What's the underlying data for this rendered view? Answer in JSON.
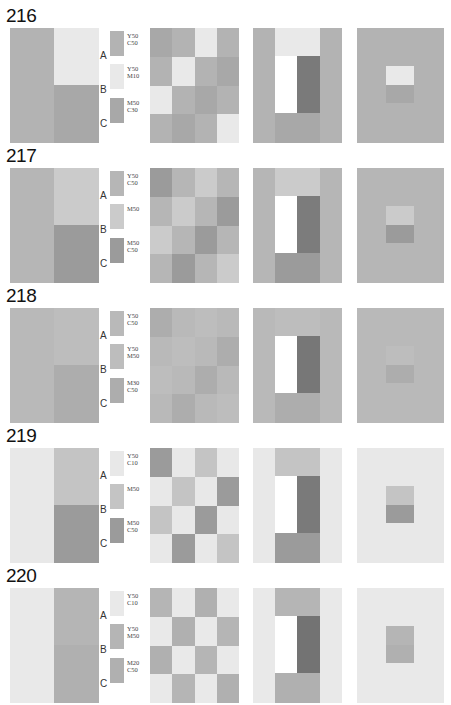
{
  "rows": [
    {
      "number": "216",
      "top": 5,
      "colors": {
        "A": "#b3b3b3",
        "B": "#e9e9e9",
        "C": "#a8a8a8",
        "dark": "#7a7a7a"
      },
      "swatches": [
        {
          "letter": "A",
          "code_line1": "Y50",
          "code_line2": "C50"
        },
        {
          "letter": "B",
          "code_line1": "Y50",
          "code_line2": "M10"
        },
        {
          "letter": "C",
          "code_line1": "M50",
          "code_line2": "C30"
        }
      ],
      "checker": [
        "C",
        "A",
        "B",
        "A",
        "A",
        "B",
        "A",
        "C",
        "B",
        "A",
        "C",
        "A",
        "A",
        "C",
        "A",
        "B"
      ]
    },
    {
      "number": "217",
      "top": 145,
      "colors": {
        "A": "#b6b6b6",
        "B": "#cbcbcb",
        "C": "#9b9b9b",
        "dark": "#7c7c7c"
      },
      "swatches": [
        {
          "letter": "A",
          "code_line1": "Y50",
          "code_line2": "C50"
        },
        {
          "letter": "B",
          "code_line1": "M50",
          "code_line2": ""
        },
        {
          "letter": "C",
          "code_line1": "M50",
          "code_line2": "C50"
        }
      ],
      "checker": [
        "C",
        "A",
        "B",
        "A",
        "A",
        "B",
        "A",
        "C",
        "B",
        "A",
        "C",
        "A",
        "A",
        "C",
        "A",
        "B"
      ]
    },
    {
      "number": "218",
      "top": 285,
      "colors": {
        "A": "#b9b9b9",
        "B": "#bdbdbd",
        "C": "#adadad",
        "dark": "#777777"
      },
      "swatches": [
        {
          "letter": "A",
          "code_line1": "Y50",
          "code_line2": "C50"
        },
        {
          "letter": "B",
          "code_line1": "Y50",
          "code_line2": "M50"
        },
        {
          "letter": "C",
          "code_line1": "M30",
          "code_line2": "C50"
        }
      ],
      "checker": [
        "C",
        "A",
        "B",
        "A",
        "A",
        "B",
        "A",
        "C",
        "B",
        "A",
        "C",
        "A",
        "A",
        "C",
        "A",
        "B"
      ]
    },
    {
      "number": "219",
      "top": 425,
      "colors": {
        "A": "#e8e8e8",
        "B": "#c4c4c4",
        "C": "#9b9b9b",
        "dark": "#7a7a7a"
      },
      "swatches": [
        {
          "letter": "A",
          "code_line1": "Y50",
          "code_line2": "C10"
        },
        {
          "letter": "B",
          "code_line1": "M50",
          "code_line2": ""
        },
        {
          "letter": "C",
          "code_line1": "M50",
          "code_line2": "C50"
        }
      ],
      "checker": [
        "C",
        "A",
        "B",
        "A",
        "A",
        "B",
        "A",
        "C",
        "B",
        "A",
        "C",
        "A",
        "A",
        "C",
        "A",
        "B"
      ]
    },
    {
      "number": "220",
      "top": 565,
      "colors": {
        "A": "#e9e9e9",
        "B": "#b5b5b5",
        "C": "#b0b0b0",
        "dark": "#737373"
      },
      "swatches": [
        {
          "letter": "A",
          "code_line1": "Y50",
          "code_line2": "C10"
        },
        {
          "letter": "B",
          "code_line1": "Y50",
          "code_line2": "M50"
        },
        {
          "letter": "C",
          "code_line1": "M20",
          "code_line2": "C50"
        }
      ],
      "checker": [
        "B",
        "A",
        "C",
        "A",
        "A",
        "C",
        "A",
        "B",
        "C",
        "A",
        "B",
        "A",
        "A",
        "B",
        "A",
        "C"
      ]
    }
  ]
}
